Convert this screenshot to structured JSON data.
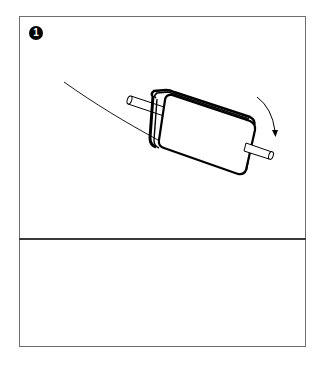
{
  "panel": {
    "step_number": "1",
    "illustration": {
      "subject": "paper-roll-rolling-on-curved-surface",
      "rotation_arrow": "clockwise-arrow"
    },
    "colors": {
      "border": "#6e6e6e",
      "divider": "#3a3a3a",
      "ink": "#000000",
      "background": "#ffffff"
    }
  },
  "caption_area": {
    "text": ""
  }
}
